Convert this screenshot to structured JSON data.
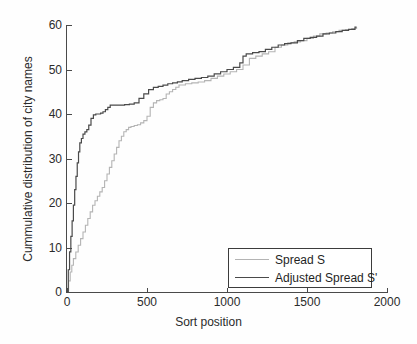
{
  "chart_data": {
    "type": "line",
    "title": "",
    "xlabel": "Sort position",
    "ylabel": "Cummulative distribution of city names",
    "xlim": [
      0,
      2000
    ],
    "ylim": [
      0,
      60
    ],
    "xticks": [
      0,
      500,
      1000,
      1500,
      2000
    ],
    "yticks": [
      0,
      10,
      20,
      30,
      40,
      50,
      60
    ],
    "grid": false,
    "legend_position": "lower-right",
    "series": [
      {
        "name": "Spread S",
        "color": "#b4b4b4",
        "x": [
          0,
          10,
          20,
          30,
          40,
          55,
          70,
          85,
          100,
          115,
          130,
          145,
          160,
          175,
          190,
          205,
          220,
          235,
          250,
          265,
          280,
          295,
          310,
          325,
          340,
          355,
          370,
          385,
          400,
          420,
          440,
          460,
          480,
          500,
          520,
          540,
          560,
          580,
          600,
          620,
          640,
          660,
          680,
          700,
          740,
          780,
          820,
          860,
          900,
          940,
          980,
          1020,
          1060,
          1100,
          1140,
          1180,
          1220,
          1260,
          1300,
          1340,
          1380,
          1420,
          1460,
          1500,
          1540,
          1580,
          1620,
          1660,
          1700,
          1740,
          1780,
          1810
        ],
        "y": [
          0,
          2.5,
          4.5,
          6.0,
          7.5,
          9.0,
          10.5,
          12.0,
          13.5,
          15.0,
          16.5,
          18.0,
          19.5,
          20.5,
          21.5,
          22.5,
          23.5,
          25.0,
          26.5,
          28.0,
          29.5,
          31.0,
          32.5,
          34.0,
          35.0,
          36.0,
          36.5,
          37.0,
          37.2,
          37.4,
          37.6,
          38.0,
          38.5,
          39.5,
          41.5,
          42.5,
          43.0,
          43.2,
          43.5,
          44.5,
          45.0,
          45.5,
          46.0,
          46.5,
          46.8,
          47.0,
          47.2,
          47.5,
          48.0,
          48.5,
          49.0,
          49.5,
          50.0,
          51.0,
          52.5,
          53.0,
          53.5,
          54.0,
          55.0,
          55.5,
          56.0,
          56.2,
          56.5,
          57.0,
          57.5,
          58.0,
          58.2,
          58.5,
          58.8,
          59.0,
          59.2,
          59.5
        ]
      },
      {
        "name": "Adjusted Spread S'",
        "color": "#4a4a4a",
        "x": [
          0,
          8,
          16,
          24,
          32,
          40,
          48,
          56,
          64,
          72,
          80,
          90,
          100,
          112,
          124,
          136,
          150,
          165,
          180,
          195,
          210,
          225,
          240,
          255,
          270,
          290,
          310,
          330,
          360,
          390,
          420,
          450,
          480,
          510,
          540,
          570,
          600,
          630,
          660,
          690,
          720,
          760,
          800,
          840,
          880,
          920,
          960,
          1000,
          1040,
          1080,
          1100,
          1120,
          1160,
          1200,
          1240,
          1280,
          1320,
          1360,
          1400,
          1440,
          1480,
          1520,
          1560,
          1600,
          1640,
          1680,
          1720,
          1760,
          1800,
          1810
        ],
        "y": [
          0,
          5.0,
          9.0,
          12.5,
          16.0,
          19.5,
          23.0,
          26.0,
          29.0,
          31.5,
          33.5,
          34.5,
          35.5,
          36.0,
          36.5,
          37.5,
          39.0,
          39.8,
          40.0,
          40.0,
          40.2,
          40.5,
          41.0,
          41.5,
          42.0,
          42.0,
          42.0,
          42.0,
          42.1,
          42.2,
          42.5,
          43.5,
          44.5,
          45.5,
          46.0,
          46.2,
          46.5,
          46.8,
          47.0,
          47.2,
          47.5,
          47.8,
          48.0,
          48.2,
          48.5,
          49.0,
          49.5,
          50.0,
          50.5,
          51.5,
          53.0,
          53.5,
          53.8,
          54.0,
          54.5,
          55.0,
          55.5,
          55.8,
          56.0,
          56.5,
          57.0,
          57.2,
          57.5,
          58.0,
          58.2,
          58.5,
          58.8,
          59.0,
          59.5,
          59.5
        ]
      }
    ]
  },
  "axes": {
    "xlabel": "Sort position",
    "ylabel": "Cummulative distribution of city names",
    "xticks": [
      "0",
      "500",
      "1000",
      "1500",
      "2000"
    ],
    "yticks": [
      "0",
      "10",
      "20",
      "30",
      "40",
      "50",
      "60"
    ]
  },
  "legend": {
    "items": [
      {
        "label": "Spread S",
        "color": "#b4b4b4"
      },
      {
        "label": "Adjusted Spread S'",
        "color": "#4a4a4a"
      }
    ]
  }
}
